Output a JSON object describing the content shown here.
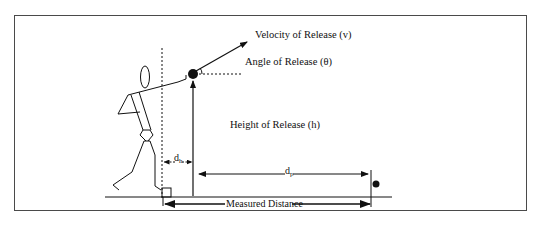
{
  "diagram": {
    "labels": {
      "velocity": "Velocity of Release (v)",
      "angle": "Angle of Release (θ)",
      "height": "Height of Release (h)",
      "dh_main": "d",
      "dh_sub": "h",
      "dp_main": "d",
      "dp_sub": "p",
      "measured": "Measured Distance"
    },
    "elements": [
      {
        "name": "athlete",
        "type": "stick-figure"
      },
      {
        "name": "release-point",
        "type": "shot-ball"
      },
      {
        "name": "landing-point",
        "type": "shot-ball"
      },
      {
        "name": "stop-board",
        "type": "square-marker"
      },
      {
        "name": "ground",
        "type": "line"
      },
      {
        "name": "throwing-circle-edge",
        "type": "dashed-vertical-line"
      }
    ],
    "colors": {
      "stroke": "#111111",
      "frame": "#4a4a4a",
      "background": "#ffffff"
    }
  }
}
